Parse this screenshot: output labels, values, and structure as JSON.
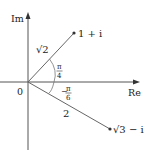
{
  "diagram": {
    "type": "complex-plane",
    "axes": {
      "x_label": "Re",
      "y_label": "Im",
      "origin_label": "0"
    },
    "points": [
      {
        "label": "1 + i",
        "modulus_label": "√2",
        "angle_label_num": "π",
        "angle_label_den": "4",
        "angle_sign": ""
      },
      {
        "label": "√3 − i",
        "modulus_label": "2",
        "angle_label_num": "π",
        "angle_label_den": "6",
        "angle_sign": "−"
      }
    ]
  },
  "colors": {
    "line": "#555555",
    "text": "#222222",
    "background": "#ffffff"
  }
}
